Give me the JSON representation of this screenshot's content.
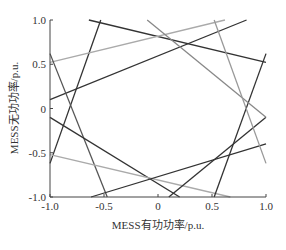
{
  "chart_data": {
    "type": "line",
    "title": "",
    "xlabel": "MESS有功功率/p.u.",
    "ylabel": "MESS无功功率/p.u.",
    "xlim": [
      -1.0,
      1.0
    ],
    "ylim": [
      -1.0,
      1.0
    ],
    "xticks": [
      "-1.0",
      "-0.5",
      "0",
      "0.5",
      "1.0"
    ],
    "xtick_values": [
      -1.0,
      -0.5,
      0,
      0.5,
      1.0
    ],
    "yticks": [
      "1.0",
      "0.5",
      "0",
      "-0.5",
      "-1.0"
    ],
    "ytick_values": [
      1.0,
      0.5,
      0,
      -0.5,
      -1.0
    ],
    "grid": false,
    "legend": null,
    "series": [
      {
        "name": "line-1",
        "color": "#333333",
        "x": [
          -0.64,
          1.0
        ],
        "y": [
          1.0,
          0.52
        ]
      },
      {
        "name": "line-2",
        "color": "#333333",
        "x": [
          -1.0,
          -0.53
        ],
        "y": [
          -0.62,
          1.0
        ]
      },
      {
        "name": "line-3",
        "color": "#aaaaaa",
        "x": [
          -1.0,
          0.62
        ],
        "y": [
          0.52,
          1.0
        ]
      },
      {
        "name": "line-4",
        "color": "#333333",
        "x": [
          -1.0,
          0.82
        ],
        "y": [
          0.1,
          1.0
        ]
      },
      {
        "name": "line-5",
        "color": "#555555",
        "x": [
          -1.0,
          -0.47
        ],
        "y": [
          0.62,
          -1.0
        ]
      },
      {
        "name": "line-6",
        "color": "#333333",
        "x": [
          -1.0,
          0.2
        ],
        "y": [
          -0.1,
          -1.0
        ]
      },
      {
        "name": "line-7",
        "color": "#aaaaaa",
        "x": [
          -1.0,
          0.67
        ],
        "y": [
          -0.52,
          -1.0
        ]
      },
      {
        "name": "line-8",
        "color": "#333333",
        "x": [
          -0.62,
          1.0
        ],
        "y": [
          -1.0,
          -0.4
        ]
      },
      {
        "name": "line-9",
        "color": "#333333",
        "x": [
          0.52,
          1.0
        ],
        "y": [
          -1.0,
          0.62
        ]
      },
      {
        "name": "line-10",
        "color": "#333333",
        "x": [
          0.1,
          1.0
        ],
        "y": [
          -1.0,
          -0.1
        ]
      },
      {
        "name": "line-11",
        "color": "#888888",
        "x": [
          -0.1,
          1.0
        ],
        "y": [
          1.0,
          -0.1
        ]
      },
      {
        "name": "line-12",
        "color": "#999999",
        "x": [
          0.52,
          1.0
        ],
        "y": [
          1.0,
          -0.62
        ]
      }
    ]
  }
}
